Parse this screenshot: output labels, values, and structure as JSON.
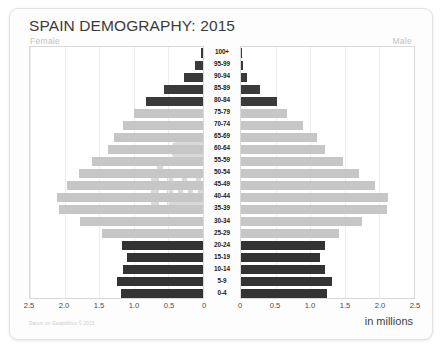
{
  "card": {
    "title": "SPAIN DEMOGRAPHY: 2015",
    "female_label": "Female",
    "male_label": "Male",
    "units_label": "in millions",
    "credit": "Datum on Geopolitics © 2015",
    "watermark_name": "spain-coat-of-arms-watermark"
  },
  "colors": {
    "old_bar": "#3a3a3a",
    "mid_bar": "#c6c6c6",
    "young_bar": "#333333",
    "grid": "#ededed",
    "frame": "#d8d8d8",
    "title_text": "#3b3b3b",
    "sex_label": "#c2c2c2"
  },
  "chart_data": {
    "type": "bar",
    "title": "SPAIN DEMOGRAPHY: 2015",
    "subtype": "population-pyramid",
    "xlabel": "in millions",
    "ylabel": "",
    "xlim": [
      0,
      2.5
    ],
    "grid": true,
    "legend": "none",
    "axis_ticks": [
      "2.5",
      "2.0",
      "1.5",
      "1.0",
      "0.5",
      "0"
    ],
    "axis_tick_values": [
      2.5,
      2.0,
      1.5,
      1.0,
      0.5,
      0
    ],
    "categories": [
      "100+",
      "95-99",
      "90-94",
      "85-89",
      "80-84",
      "75-79",
      "70-74",
      "65-69",
      "60-64",
      "55-59",
      "50-54",
      "45-49",
      "40-44",
      "35-39",
      "30-34",
      "25-29",
      "20-24",
      "15-19",
      "10-14",
      "5-9",
      "0-4"
    ],
    "series": [
      {
        "name": "Female",
        "side": "left",
        "values": [
          0.03,
          0.11,
          0.27,
          0.57,
          0.83,
          1.0,
          1.16,
          1.29,
          1.38,
          1.6,
          1.79,
          1.97,
          2.11,
          2.08,
          1.78,
          1.46,
          1.17,
          1.1,
          1.16,
          1.25,
          1.19
        ]
      },
      {
        "name": "Male",
        "side": "right",
        "values": [
          0.01,
          0.03,
          0.09,
          0.28,
          0.52,
          0.66,
          0.9,
          1.1,
          1.21,
          1.48,
          1.71,
          1.93,
          2.13,
          2.11,
          1.75,
          1.42,
          1.21,
          1.14,
          1.21,
          1.32,
          1.24
        ]
      }
    ],
    "band_groups": {
      "old": [
        "100+",
        "95-99",
        "90-94",
        "85-89",
        "80-84"
      ],
      "mid": [
        "75-79",
        "70-74",
        "65-69",
        "60-64",
        "55-59",
        "50-54",
        "45-49",
        "40-44",
        "35-39",
        "30-34",
        "25-29"
      ],
      "young": [
        "20-24",
        "15-19",
        "10-14",
        "5-9",
        "0-4"
      ]
    }
  }
}
